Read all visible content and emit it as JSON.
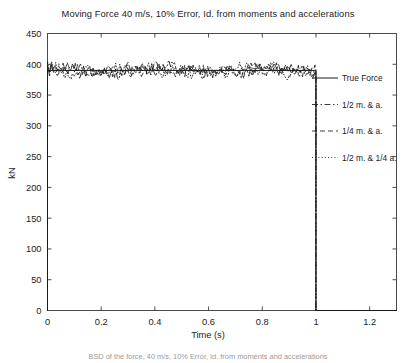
{
  "chart_data": {
    "type": "line",
    "title": "Moving Force 40 m/s, 10% Error, Id. from moments and accelerations",
    "xlabel": "Time (s)",
    "ylabel": "kN",
    "xlim": [
      0,
      1.3
    ],
    "ylim": [
      0,
      450
    ],
    "xticks": [
      0,
      0.2,
      0.4,
      0.6,
      0.8,
      1,
      1.2
    ],
    "xticklabels": [
      "0",
      "0.2",
      "0.4",
      "0.6",
      "0.8",
      "1",
      "1.2"
    ],
    "yticks": [
      0,
      50,
      100,
      150,
      200,
      250,
      300,
      350,
      400,
      450
    ],
    "yticklabels": [
      "0",
      "50",
      "100",
      "150",
      "200",
      "250",
      "300",
      "350",
      "400",
      "450"
    ],
    "grid": false,
    "legend_position": "right-inside",
    "legend": [
      "True Force",
      "1/2 m. & a.",
      "1/4 m. & a.",
      "1/2 m. & 1/4 a."
    ],
    "nominal_force_kN": 390,
    "force_on_interval": [
      0,
      1
    ],
    "series": [
      {
        "name": "True Force",
        "style": "solid",
        "x": [
          0,
          0.02,
          0.06,
          0.1,
          0.2,
          0.3,
          0.4,
          0.5,
          0.6,
          0.7,
          0.8,
          0.9,
          0.98,
          1.0,
          1.3
        ],
        "values": [
          0,
          390,
          390,
          390,
          390,
          390,
          390,
          390,
          390,
          390,
          390,
          390,
          390,
          0,
          0
        ]
      },
      {
        "name": "1/2 m. & a.",
        "style": "dashdot",
        "x": [
          0,
          0.02,
          0.06,
          0.1,
          0.2,
          0.3,
          0.4,
          0.5,
          0.6,
          0.7,
          0.8,
          0.9,
          0.98,
          1.0,
          1.3
        ],
        "values": [
          0,
          395,
          388,
          392,
          386,
          398,
          384,
          393,
          389,
          396,
          382,
          391,
          394,
          0,
          0
        ]
      },
      {
        "name": "1/4 m. & a.",
        "style": "dashed",
        "x": [
          0,
          0.02,
          0.06,
          0.1,
          0.2,
          0.3,
          0.4,
          0.5,
          0.6,
          0.7,
          0.8,
          0.9,
          0.98,
          1.0,
          1.3
        ],
        "values": [
          0,
          386,
          397,
          383,
          394,
          388,
          399,
          381,
          392,
          387,
          395,
          384,
          390,
          0,
          0
        ]
      },
      {
        "name": "1/2 m. & 1/4 a.",
        "style": "dotted",
        "x": [
          0,
          0.02,
          0.06,
          0.1,
          0.2,
          0.3,
          0.4,
          0.5,
          0.6,
          0.7,
          0.8,
          0.9,
          0.98,
          1.0,
          1.3
        ],
        "values": [
          0,
          392,
          384,
          398,
          382,
          393,
          387,
          396,
          385,
          391,
          397,
          383,
          389,
          0,
          0
        ]
      }
    ],
    "noise_band_kN": [
      360,
      415
    ]
  },
  "caption": "BSD of the force, 40 m/s, 10% Error, Id. from moments and accelerations"
}
